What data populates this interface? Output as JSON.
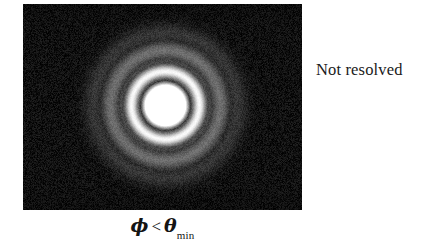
{
  "figure": {
    "kind": "airy-diffraction-pattern",
    "panel": {
      "name": "unresolved-airy-disk-image",
      "background_color": "#090909",
      "x": 23,
      "y": 4,
      "width": 279,
      "height": 206
    },
    "annotation": {
      "label": "Not resolved",
      "color": "#1a1a1a",
      "x": 316,
      "y": 60
    },
    "caption": {
      "phi": "ϕ",
      "relation": "<",
      "theta": "θ",
      "subscript": "min",
      "full_text": "ϕ < θmin",
      "color": "#141414"
    }
  },
  "chart_data": {
    "type": "heatmap",
    "title": "",
    "subtitle": "",
    "xlabel": "",
    "ylabel": "",
    "colormap": "grayscale",
    "value_range": [
      0,
      255
    ],
    "background_level": 14,
    "noise_amplitude": 26,
    "sources": [
      {
        "name": "central-airy-disk",
        "center_x": 142,
        "center_y": 101,
        "peak_intensity": 255,
        "core_radius": 23,
        "rings": [
          {
            "radius": 23,
            "width": 5,
            "intensity": 40,
            "kind": "dark-gap"
          },
          {
            "radius": 34,
            "width": 8,
            "intensity": 235,
            "kind": "bright-ring"
          },
          {
            "radius": 44,
            "width": 6,
            "intensity": 55,
            "kind": "dark-gap"
          },
          {
            "radius": 55,
            "width": 11,
            "intensity": 95,
            "kind": "diffuse-ring"
          },
          {
            "radius": 72,
            "width": 12,
            "intensity": 38,
            "kind": "faint-ring"
          }
        ]
      }
    ],
    "axis_ranges": {
      "x": [
        0,
        279
      ],
      "y": [
        0,
        206
      ]
    },
    "grid": false,
    "legend": false,
    "annotations": [
      {
        "text": "Not resolved",
        "x": 316,
        "y": 60
      },
      {
        "text": "ϕ < θmin",
        "x": 162,
        "y": 228
      }
    ]
  }
}
